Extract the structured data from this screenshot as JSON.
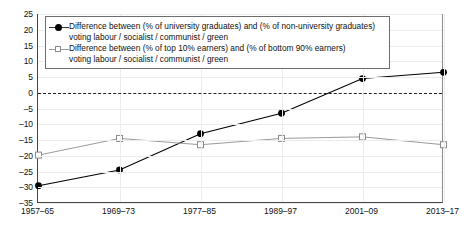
{
  "chart_data": {
    "type": "line",
    "title": "",
    "subtitle": "",
    "xlabel": "",
    "ylabel": "",
    "categories": [
      "1957–65",
      "1969–73",
      "1977–85",
      "1989–97",
      "2001–09",
      "2013–17"
    ],
    "ylim": [
      -35,
      25
    ],
    "yticks": [
      25,
      20,
      15,
      10,
      5,
      0,
      -5,
      -10,
      -15,
      -20,
      -25,
      -30,
      -35
    ],
    "ytick_labels": [
      "25",
      "20",
      "15",
      "10",
      "5",
      "0",
      "–5",
      "–10",
      "–15",
      "–20",
      "–25",
      "–30",
      "–35"
    ],
    "grid": true,
    "zero_reference_line": 0,
    "legend_position": "upper-left",
    "series": [
      {
        "name": "Difference between (% of university graduates) and (% of non-university graduates) voting labour / socialist / communist / green",
        "legend_line1": "Difference between (% of university graduates) and (% of non-university graduates)",
        "legend_line2": "voting labour / socialist / communist / green",
        "marker": "filled-circle",
        "color": "#000000",
        "values": [
          -29.5,
          -24.5,
          -13.0,
          -6.5,
          4.5,
          6.5
        ]
      },
      {
        "name": "Difference between (% of top 10% earners) and (% of bottom 90% earners) voting labour / socialist / communist / green",
        "legend_line1": "Difference between (% of top 10% earners) and (% of bottom 90% earners)",
        "legend_line2": "voting labour / socialist / communist / green",
        "marker": "open-square",
        "color": "#9a9a9a",
        "values": [
          -19.8,
          -14.5,
          -16.5,
          -14.5,
          -14.0,
          -16.5
        ]
      }
    ]
  }
}
